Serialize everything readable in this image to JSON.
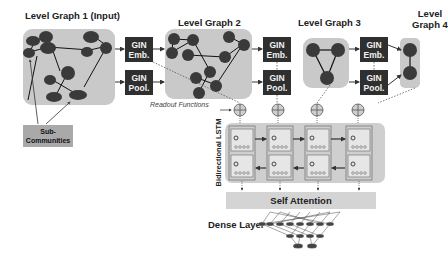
{
  "titles": {
    "level1": "Level Graph 1 (Input)",
    "level2": "Level Graph 2",
    "level3": "Level Graph 3",
    "level4_line1": "Level",
    "level4_line2": "Graph 4"
  },
  "gin_blocks": [
    {
      "line1": "GIN",
      "line2": "Emb."
    },
    {
      "line1": "GIN",
      "line2": "Pool."
    },
    {
      "line1": "GIN",
      "line2": "Emb."
    },
    {
      "line1": "GIN",
      "line2": "Pool."
    },
    {
      "line1": "GIN",
      "line2": "Emb."
    },
    {
      "line1": "GIN",
      "line2": "Pool."
    }
  ],
  "sub_communities": {
    "line1": "Sub-",
    "line2": "Communities"
  },
  "readout_label": "Readout Functions",
  "lstm_label": "Bidirectional LSTM",
  "self_attention": "Self Attention",
  "dense_layer": "Dense Layer",
  "colors": {
    "node": "#3a3a3a",
    "graph_bg": "#c9c9c9",
    "gin_bg": "#2f2f2f",
    "lstm_bg": "#cfcfcf",
    "attention_bg": "#d4d4d4",
    "sub_bg": "#a9a9a9"
  }
}
